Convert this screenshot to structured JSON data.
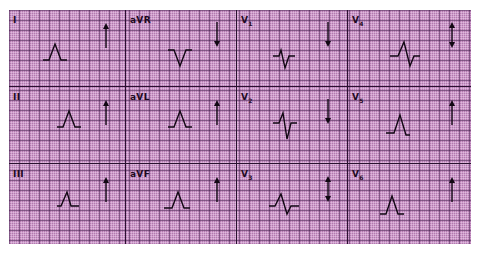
{
  "diagram": {
    "colors": {
      "paper": "#b37ab0",
      "grid_major": "#3c1446",
      "trace": "#120814"
    },
    "layout": {
      "rows": 3,
      "columns": 4
    },
    "leads": [
      {
        "id": "I",
        "label": "I",
        "sub": "",
        "morphology": "upright",
        "arrow": "up"
      },
      {
        "id": "aVR",
        "label": "aVR",
        "sub": "",
        "morphology": "inverted",
        "arrow": "down"
      },
      {
        "id": "V1",
        "label": "V",
        "sub": "1",
        "morphology": "rS",
        "arrow": "down"
      },
      {
        "id": "V4",
        "label": "V",
        "sub": "4",
        "morphology": "RS",
        "arrow": "both"
      },
      {
        "id": "II",
        "label": "II",
        "sub": "",
        "morphology": "upright",
        "arrow": "up"
      },
      {
        "id": "aVL",
        "label": "aVL",
        "sub": "",
        "morphology": "upright",
        "arrow": "up"
      },
      {
        "id": "V2",
        "label": "V",
        "sub": "2",
        "morphology": "rS",
        "arrow": "down"
      },
      {
        "id": "V5",
        "label": "V",
        "sub": "5",
        "morphology": "upright",
        "arrow": "up"
      },
      {
        "id": "III",
        "label": "III",
        "sub": "",
        "morphology": "upright",
        "arrow": "up"
      },
      {
        "id": "aVF",
        "label": "aVF",
        "sub": "",
        "morphology": "upright",
        "arrow": "up"
      },
      {
        "id": "V3",
        "label": "V",
        "sub": "3",
        "morphology": "RS",
        "arrow": "both"
      },
      {
        "id": "V6",
        "label": "V",
        "sub": "6",
        "morphology": "upright",
        "arrow": "up"
      }
    ]
  }
}
